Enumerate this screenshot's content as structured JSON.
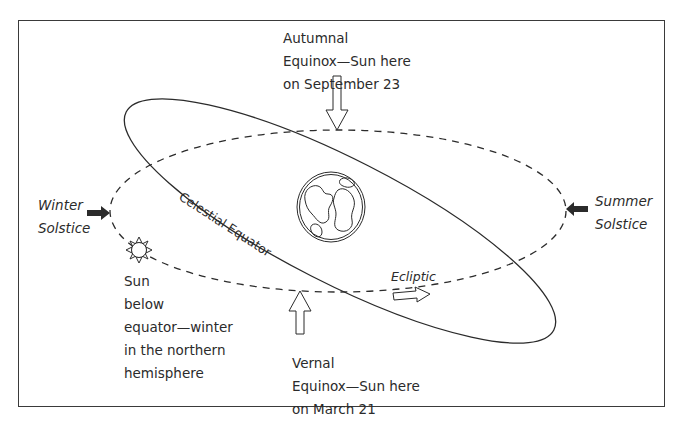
{
  "diagram": {
    "title": "",
    "colors": {
      "line": "#2b2b2b",
      "background": "#ffffff",
      "frame": "#3a3a3a"
    },
    "labels": {
      "autumnal": "Autumnal\nEquinox—Sun here\non September 23",
      "vernal": "Vernal\nEquinox—Sun here\non March 21",
      "winter": "Winter\nSolstice",
      "summer": "Summer\nSolstice",
      "sun_note": "Sun\nbelow\nequator—winter\nin the northern\nhemisphere",
      "celestial_equator": "Celestial Equator",
      "ecliptic": "Ecliptic"
    },
    "elements": {
      "ecliptic_path": "dashed ellipse",
      "celestial_equator_path": "solid tilted ellipse",
      "earth": "globe-icon",
      "sun": "sun-icon",
      "arrows": [
        "autumnal-equinox-arrow",
        "vernal-equinox-arrow",
        "winter-solstice-arrow",
        "summer-solstice-arrow",
        "ecliptic-direction-arrow"
      ]
    }
  }
}
